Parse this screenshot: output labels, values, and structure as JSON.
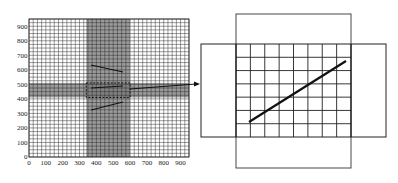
{
  "left_chart": {
    "x_ticks": [
      "0",
      "100",
      "200",
      "300",
      "400",
      "500",
      "600",
      "700",
      "800",
      "900"
    ],
    "y_ticks": [
      "0",
      "100",
      "200",
      "300",
      "400",
      "500",
      "600",
      "700",
      "800",
      "900"
    ],
    "x_range": [
      0,
      950
    ],
    "y_range": [
      0,
      950
    ],
    "grid_step": 25,
    "vertical_band": {
      "x_from": 340,
      "x_to": 600,
      "color": "#7a7a7a"
    },
    "horizontal_band": {
      "y_from": 410,
      "y_to": 510,
      "color": "#7a7a7a"
    },
    "dashed_box": {
      "x_from": 340,
      "x_to": 600,
      "y_from": 410,
      "y_to": 510
    },
    "arrow": {
      "from_label": "selected region",
      "to_label": "zoomed view"
    }
  },
  "right_diagram": {
    "grid_columns": 8,
    "grid_rows": 7,
    "description": "zoomed cross-shaped region with grid and diagonal line segment"
  },
  "colors": {
    "line": "#111111",
    "grid": "#222222",
    "band": "#7a7a7a",
    "background": "#ffffff"
  }
}
